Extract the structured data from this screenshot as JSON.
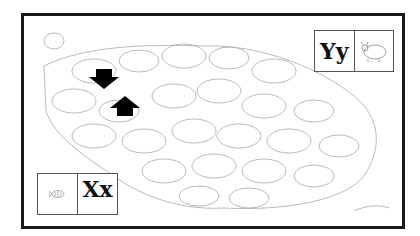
{
  "page": {
    "colors": {
      "ink": "#1a1a1a",
      "sketch": "#9a9a9a",
      "background": "#ffffff"
    }
  },
  "letter_boxes": [
    {
      "id": "yy",
      "letter": "Yy",
      "picture": "yak-icon",
      "position": "top-right"
    },
    {
      "id": "xx",
      "letter": "Xx",
      "picture": "xray-fish-icon",
      "position": "bottom-left"
    }
  ],
  "arrows": [
    {
      "direction": "down",
      "color": "#000000"
    },
    {
      "direction": "up",
      "color": "#000000"
    }
  ],
  "scene": {
    "subject": "herd of yaks",
    "style": "line-drawing"
  }
}
